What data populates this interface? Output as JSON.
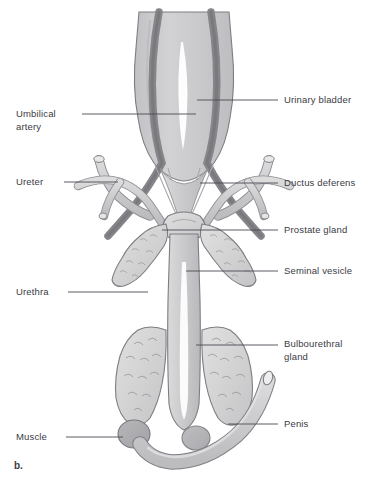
{
  "figure": {
    "caption": "b.",
    "background_color": "#ffffff"
  },
  "colors": {
    "organ_fill": "#c9c9cb",
    "organ_fill_light": "#d7d7d8",
    "organ_fill_pale": "#dedede",
    "artery_fill": "#8a8a8e",
    "muscle_fill": "#b0b0b3",
    "outline": "#6e6e73",
    "outline_soft": "#8c8c92",
    "highlight": "#ffffff",
    "leader_line": "#4a4a52",
    "text": "#3b3b44"
  },
  "labels": {
    "left": [
      {
        "id": "umbilical-artery",
        "text": "Umbilical\nartery",
        "x": 16,
        "y": 108,
        "leader": {
          "x1": 82,
          "y1": 114,
          "x2": 196,
          "y2": 114
        }
      },
      {
        "id": "ureter",
        "text": "Ureter",
        "x": 16,
        "y": 176,
        "leader": {
          "x1": 64,
          "y1": 182,
          "x2": 118,
          "y2": 182
        }
      },
      {
        "id": "urethra",
        "text": "Urethra",
        "x": 16,
        "y": 286,
        "leader": {
          "x1": 68,
          "y1": 292,
          "x2": 148,
          "y2": 292
        }
      },
      {
        "id": "muscle",
        "text": "Muscle",
        "x": 16,
        "y": 431,
        "leader": {
          "x1": 66,
          "y1": 437,
          "x2": 123,
          "y2": 437
        }
      }
    ],
    "right": [
      {
        "id": "urinary-bladder",
        "text": "Urinary bladder",
        "x": 284,
        "y": 94,
        "leader": {
          "x1": 197,
          "y1": 100,
          "x2": 278,
          "y2": 100
        }
      },
      {
        "id": "ductus-deferens",
        "text": "Ductus deferens",
        "x": 284,
        "y": 177,
        "leader": {
          "x1": 200,
          "y1": 183,
          "x2": 278,
          "y2": 183
        }
      },
      {
        "id": "prostate-gland",
        "text": "Prostate gland",
        "x": 284,
        "y": 224,
        "leader": {
          "x1": 162,
          "y1": 230,
          "x2": 278,
          "y2": 230
        }
      },
      {
        "id": "seminal-vesicle",
        "text": "Seminal vesicle",
        "x": 284,
        "y": 265,
        "leader": {
          "x1": 186,
          "y1": 271,
          "x2": 278,
          "y2": 271
        }
      },
      {
        "id": "bulbourethral-gland",
        "text": "Bulbourethral\ngland",
        "x": 284,
        "y": 338,
        "leader": {
          "x1": 196,
          "y1": 345,
          "x2": 278,
          "y2": 345
        }
      },
      {
        "id": "penis",
        "text": "Penis",
        "x": 284,
        "y": 418,
        "leader": {
          "x1": 228,
          "y1": 424,
          "x2": 278,
          "y2": 424
        }
      }
    ]
  },
  "structures": [
    {
      "id": "urinary-bladder",
      "name": "Urinary bladder"
    },
    {
      "id": "umbilical-artery-left",
      "name": "Umbilical artery (left)"
    },
    {
      "id": "umbilical-artery-right",
      "name": "Umbilical artery (right)"
    },
    {
      "id": "ureter-left",
      "name": "Ureter (left)"
    },
    {
      "id": "ureter-right",
      "name": "Ureter (right)"
    },
    {
      "id": "ductus-deferens-left",
      "name": "Ductus deferens (left)"
    },
    {
      "id": "ductus-deferens-right",
      "name": "Ductus deferens (right)"
    },
    {
      "id": "prostate-gland",
      "name": "Prostate gland"
    },
    {
      "id": "seminal-vesicle-left",
      "name": "Seminal vesicle (left)"
    },
    {
      "id": "seminal-vesicle-right",
      "name": "Seminal vesicle (right)"
    },
    {
      "id": "urethra",
      "name": "Urethra"
    },
    {
      "id": "bulbourethral-gland-left",
      "name": "Bulbourethral gland (left)"
    },
    {
      "id": "bulbourethral-gland-right",
      "name": "Bulbourethral gland (right)"
    },
    {
      "id": "muscle",
      "name": "Muscle"
    },
    {
      "id": "penis",
      "name": "Penis"
    }
  ]
}
